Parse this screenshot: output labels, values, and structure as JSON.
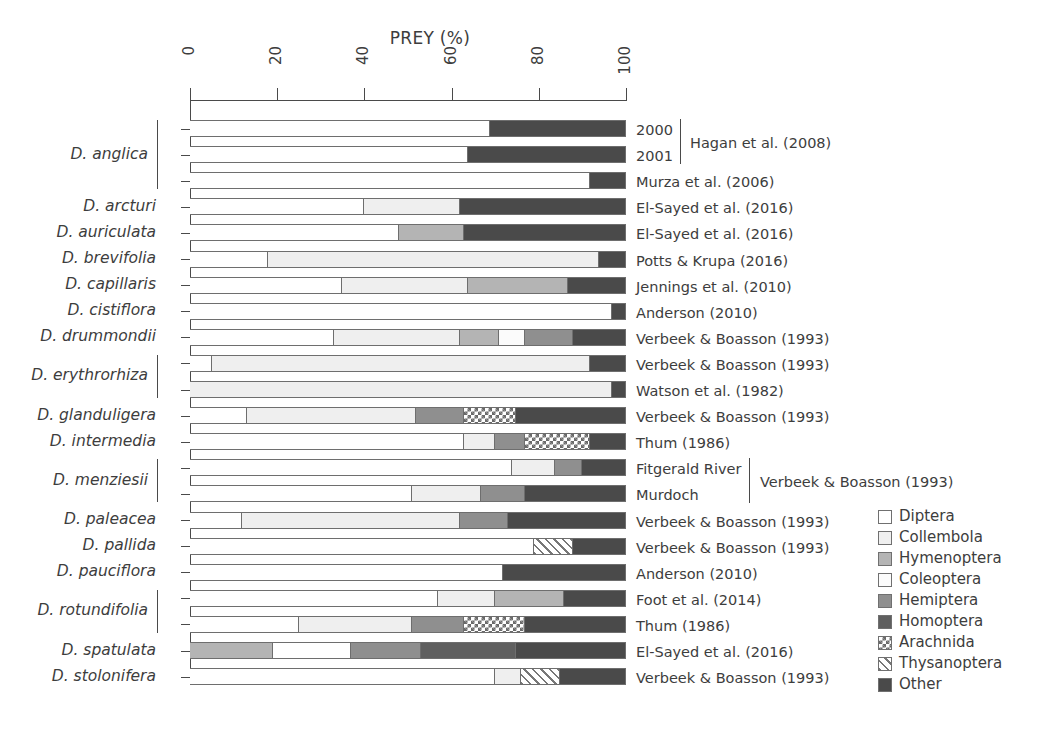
{
  "chart_data": {
    "type": "bar",
    "orientation": "horizontal",
    "stacked": true,
    "normalized_percent": true,
    "title": "PREY (%)",
    "xlabel": "PREY (%)",
    "ylabel": "",
    "xlim": [
      0,
      100
    ],
    "xticks": [
      0,
      20,
      40,
      60,
      80,
      100
    ],
    "grid": false,
    "legend_position": "right-bottom",
    "legend": [
      {
        "name": "Diptera",
        "fill": "white"
      },
      {
        "name": "Collembola",
        "fill": "very-light-gray"
      },
      {
        "name": "Hymenoptera",
        "fill": "medium-gray"
      },
      {
        "name": "Coleoptera",
        "fill": "near-white"
      },
      {
        "name": "Hemiptera",
        "fill": "gray"
      },
      {
        "name": "Homoptera",
        "fill": "dark-gray"
      },
      {
        "name": "Arachnida",
        "fill": "checkered"
      },
      {
        "name": "Thysanoptera",
        "fill": "diagonal-hatch"
      },
      {
        "name": "Other",
        "fill": "darkest-gray"
      }
    ],
    "categories": [
      "Diptera",
      "Collembola",
      "Hymenoptera",
      "Coleoptera",
      "Hemiptera",
      "Homoptera",
      "Arachnida",
      "Thysanoptera",
      "Other"
    ],
    "rows": [
      {
        "species": "D. anglica",
        "sublabel": "2000",
        "citation": "Hagan et al. (2008)",
        "values": {
          "Diptera": 69,
          "Other": 31
        }
      },
      {
        "species": "D. anglica",
        "sublabel": "2001",
        "citation": "Hagan et al. (2008)",
        "values": {
          "Diptera": 64,
          "Other": 36
        }
      },
      {
        "species": "D. anglica",
        "sublabel": "",
        "citation": "Murza et al. (2006)",
        "values": {
          "Diptera": 92,
          "Other": 8
        }
      },
      {
        "species": "D. arcturi",
        "sublabel": "",
        "citation": "El-Sayed et al. (2016)",
        "values": {
          "Diptera": 40,
          "Collembola": 22,
          "Other": 38
        }
      },
      {
        "species": "D. auriculata",
        "sublabel": "",
        "citation": "El-Sayed et al. (2016)",
        "values": {
          "Diptera": 48,
          "Hymenoptera": 15,
          "Other": 37
        }
      },
      {
        "species": "D. brevifolia",
        "sublabel": "",
        "citation": "Potts & Krupa (2016)",
        "values": {
          "Diptera": 18,
          "Collembola": 76,
          "Other": 6
        }
      },
      {
        "species": "D. capillaris",
        "sublabel": "",
        "citation": "Jennings et al. (2010)",
        "values": {
          "Diptera": 35,
          "Collembola": 29,
          "Hymenoptera": 23,
          "Other": 13
        }
      },
      {
        "species": "D. cistiflora",
        "sublabel": "",
        "citation": "Anderson (2010)",
        "values": {
          "Diptera": 97,
          "Other": 3
        }
      },
      {
        "species": "D. drummondii",
        "sublabel": "",
        "citation": "Verbeek & Boasson (1993)",
        "values": {
          "Diptera": 33,
          "Collembola": 29,
          "Hymenoptera": 9,
          "Coleoptera": 6,
          "Hemiptera": 11,
          "Other": 12
        }
      },
      {
        "species": "D. erythrorhiza",
        "sublabel": "",
        "citation": "Verbeek & Boasson (1993)",
        "values": {
          "Diptera": 5,
          "Collembola": 87,
          "Other": 8
        }
      },
      {
        "species": "D. erythrorhiza",
        "sublabel": "",
        "citation": "Watson et al. (1982)",
        "values": {
          "Collembola": 97,
          "Other": 3
        }
      },
      {
        "species": "D. glanduligera",
        "sublabel": "",
        "citation": "Verbeek & Boasson (1993)",
        "values": {
          "Diptera": 13,
          "Collembola": 39,
          "Hemiptera": 11,
          "Arachnida": 12,
          "Other": 25
        }
      },
      {
        "species": "D. intermedia",
        "sublabel": "",
        "citation": "Thum (1986)",
        "values": {
          "Diptera": 63,
          "Collembola": 7,
          "Hemiptera": 7,
          "Arachnida": 15,
          "Other": 8
        }
      },
      {
        "species": "D. menziesii",
        "sublabel": "Fitgerald River",
        "citation": "Verbeek & Boasson (1993)",
        "values": {
          "Diptera": 74,
          "Collembola": 10,
          "Hemiptera": 6,
          "Other": 10
        }
      },
      {
        "species": "D. menziesii",
        "sublabel": "Murdoch",
        "citation": "Verbeek & Boasson (1993)",
        "values": {
          "Diptera": 51,
          "Collembola": 16,
          "Hemiptera": 10,
          "Other": 23
        }
      },
      {
        "species": "D. paleacea",
        "sublabel": "",
        "citation": "Verbeek & Boasson (1993)",
        "values": {
          "Diptera": 12,
          "Collembola": 50,
          "Hemiptera": 11,
          "Other": 27
        }
      },
      {
        "species": "D. pallida",
        "sublabel": "",
        "citation": "Verbeek & Boasson (1993)",
        "values": {
          "Diptera": 79,
          "Thysanoptera": 9,
          "Other": 12
        }
      },
      {
        "species": "D. pauciflora",
        "sublabel": "",
        "citation": "Anderson (2010)",
        "values": {
          "Diptera": 72,
          "Other": 28
        }
      },
      {
        "species": "D. rotundifolia",
        "sublabel": "",
        "citation": "Foot et al. (2014)",
        "values": {
          "Diptera": 57,
          "Collembola": 13,
          "Hymenoptera": 16,
          "Other": 14
        }
      },
      {
        "species": "D. rotundifolia",
        "sublabel": "",
        "citation": "Thum (1986)",
        "values": {
          "Diptera": 25,
          "Collembola": 26,
          "Hemiptera": 12,
          "Arachnida": 14,
          "Other": 23
        }
      },
      {
        "species": "D. spatulata",
        "sublabel": "",
        "citation": "El-Sayed et al. (2016)",
        "values": {
          "Hymenoptera": 19,
          "Diptera": 18,
          "Hemiptera": 16,
          "Homoptera": 22,
          "Other": 25
        }
      },
      {
        "species": "D. stolonifera",
        "sublabel": "",
        "citation": "Verbeek & Boasson (1993)",
        "values": {
          "Diptera": 70,
          "Collembola": 6,
          "Thysanoptera": 9,
          "Other": 15
        }
      }
    ]
  },
  "axis": {
    "tick_labels": [
      "0",
      "20",
      "40",
      "60",
      "80",
      "100"
    ]
  },
  "species_labels": [
    {
      "text": "D. anglica",
      "bracket": true
    },
    {
      "text": "D. arcturi",
      "bracket": false
    },
    {
      "text": "D. auriculata",
      "bracket": false
    },
    {
      "text": "D. brevifolia",
      "bracket": false
    },
    {
      "text": "D. capillaris",
      "bracket": false
    },
    {
      "text": "D. cistiflora",
      "bracket": false
    },
    {
      "text": "D. drummondii",
      "bracket": false
    },
    {
      "text": "D. erythrorhiza",
      "bracket": true
    },
    {
      "text": "D. glanduligera",
      "bracket": false
    },
    {
      "text": "D. intermedia",
      "bracket": false
    },
    {
      "text": "D. menziesii",
      "bracket": true
    },
    {
      "text": "D. paleacea",
      "bracket": false
    },
    {
      "text": "D. pallida",
      "bracket": false
    },
    {
      "text": "D. pauciflora",
      "bracket": false
    },
    {
      "text": "D. rotundifolia",
      "bracket": true
    },
    {
      "text": "D. spatulata",
      "bracket": false
    },
    {
      "text": "D. stolonifera",
      "bracket": false
    }
  ],
  "citations": {
    "simple": [
      "Murza et al. (2006)",
      "El-Sayed et al. (2016)",
      "El-Sayed et al. (2016)",
      "Potts & Krupa (2016)",
      "Jennings et al. (2010)",
      "Anderson (2010)",
      "Verbeek & Boasson (1993)",
      "Verbeek & Boasson (1993)",
      "Watson et al. (1982)",
      "Verbeek & Boasson (1993)",
      "Thum (1986)",
      "Verbeek & Boasson (1993)",
      "Verbeek & Boasson (1993)",
      "Anderson (2010)",
      "Foot et al. (2014)",
      "Thum (1986)",
      "El-Sayed et al. (2016)",
      "Verbeek & Boasson (1993)"
    ],
    "group_hagan": {
      "year_1": "2000",
      "year_2": "2001",
      "label": "Hagan et al. (2008)"
    },
    "group_menziesii": {
      "site_1": "Fitgerald River",
      "site_2": "Murdoch",
      "label": "Verbeek & Boasson (1993)"
    }
  },
  "legend": {
    "items": [
      "Diptera",
      "Collembola",
      "Hymenoptera",
      "Coleoptera",
      "Hemiptera",
      "Homoptera",
      "Arachnida",
      "Thysanoptera",
      "Other"
    ]
  }
}
